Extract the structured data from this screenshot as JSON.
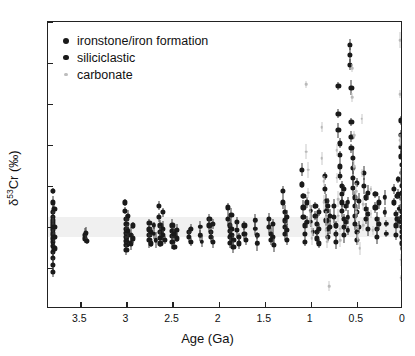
{
  "figure": {
    "background": "#ffffff",
    "frame_color": "#222222",
    "zero_band_color": "#ededed"
  },
  "legend": {
    "position": "top-left",
    "items": [
      {
        "label": "ironstone/iron formation",
        "marker": "filled-circle",
        "color": "#1a1a1a",
        "size": 5.2
      },
      {
        "label": "siliciclastic",
        "marker": "filled-circle",
        "color": "#1a1a1a",
        "size": 4.6
      },
      {
        "label": "carbonate",
        "marker": "small-dot",
        "color": "#b9b9b9",
        "size": 2.6
      }
    ]
  },
  "chart_data": {
    "type": "scatter",
    "title": "",
    "xlabel": "Age (Ga)",
    "ylabel": "δ53Cr (‰)",
    "ylabel_parts": {
      "delta": "δ",
      "mass": "53",
      "element": "Cr (‰)"
    },
    "xlim": [
      3.85,
      0.0
    ],
    "ylim": [
      -1.0,
      2.5
    ],
    "x_reversed": true,
    "grid": false,
    "xticks": [
      3.5,
      3,
      2.5,
      2,
      1.5,
      1,
      0.5,
      0
    ],
    "xticklabels": [
      "3.5",
      "3",
      "2.5",
      "2",
      "1.5",
      "1",
      "0.5",
      "0"
    ],
    "yticks": [
      -1,
      -0.5,
      0,
      0.5,
      1,
      1.5,
      2,
      2.5
    ],
    "yticklabels": [
      "-1",
      "-0.5",
      "0",
      "0.5",
      "1",
      "1.5",
      "2",
      "2.5"
    ],
    "zero_band": {
      "ymin": -0.12,
      "ymax": 0.12
    },
    "series": [
      {
        "name": "ironstone/iron formation",
        "color": "#1a1a1a",
        "marker_size": 5.2,
        "points": [
          [
            3.8,
            0.44
          ],
          [
            3.8,
            0.3
          ],
          [
            3.8,
            0.18
          ],
          [
            3.8,
            0.12
          ],
          [
            3.8,
            0.08
          ],
          [
            3.8,
            0.05
          ],
          [
            3.8,
            0.02
          ],
          [
            3.8,
            -0.01
          ],
          [
            3.8,
            -0.04
          ],
          [
            3.8,
            -0.07
          ],
          [
            3.8,
            -0.1
          ],
          [
            3.8,
            -0.14
          ],
          [
            3.8,
            -0.18
          ],
          [
            3.8,
            -0.23
          ],
          [
            3.8,
            -0.3
          ],
          [
            3.8,
            -0.38
          ],
          [
            3.8,
            -0.46
          ],
          [
            3.8,
            -0.55
          ],
          [
            3.78,
            0.22
          ],
          [
            3.78,
            0.0
          ],
          [
            3.78,
            -0.12
          ],
          [
            3.78,
            -0.26
          ],
          [
            3.45,
            -0.1
          ],
          [
            3.45,
            -0.14
          ],
          [
            3.43,
            -0.17
          ],
          [
            3.44,
            -0.07
          ],
          [
            3.02,
            0.3
          ],
          [
            3.02,
            0.2
          ],
          [
            3.0,
            0.1
          ],
          [
            3.0,
            0.04
          ],
          [
            3.0,
            -0.02
          ],
          [
            3.0,
            -0.07
          ],
          [
            3.0,
            -0.12
          ],
          [
            3.0,
            -0.17
          ],
          [
            3.0,
            -0.22
          ],
          [
            3.0,
            -0.28
          ],
          [
            2.98,
            0.14
          ],
          [
            2.98,
            -0.05
          ],
          [
            2.95,
            -0.1
          ],
          [
            2.95,
            -0.2
          ],
          [
            2.93,
            0.02
          ],
          [
            2.93,
            -0.14
          ],
          [
            2.75,
            0.05
          ],
          [
            2.75,
            -0.03
          ],
          [
            2.75,
            -0.1
          ],
          [
            2.75,
            -0.16
          ],
          [
            2.73,
            -0.06
          ],
          [
            2.73,
            -0.2
          ],
          [
            2.65,
            0.26
          ],
          [
            2.65,
            0.12
          ],
          [
            2.63,
            0.02
          ],
          [
            2.63,
            -0.06
          ],
          [
            2.63,
            -0.13
          ],
          [
            2.63,
            -0.2
          ],
          [
            2.6,
            0.18
          ],
          [
            2.6,
            -0.02
          ],
          [
            2.6,
            -0.1
          ],
          [
            2.58,
            -0.16
          ],
          [
            2.5,
            0.02
          ],
          [
            2.5,
            -0.05
          ],
          [
            2.5,
            -0.11
          ],
          [
            2.5,
            -0.18
          ],
          [
            2.48,
            -0.08
          ],
          [
            2.48,
            -0.24
          ],
          [
            2.45,
            -0.04
          ],
          [
            2.45,
            -0.14
          ],
          [
            2.32,
            -0.06
          ],
          [
            2.32,
            -0.12
          ],
          [
            2.3,
            -0.18
          ],
          [
            2.3,
            -0.02
          ],
          [
            2.1,
            0.1
          ],
          [
            2.1,
            0.02
          ],
          [
            2.08,
            -0.06
          ],
          [
            2.08,
            -0.12
          ],
          [
            2.06,
            -0.18
          ],
          [
            2.06,
            0.04
          ],
          [
            1.9,
            0.24
          ],
          [
            1.9,
            0.1
          ],
          [
            1.88,
            0.02
          ],
          [
            1.88,
            -0.05
          ],
          [
            1.88,
            -0.12
          ],
          [
            1.88,
            -0.19
          ],
          [
            1.86,
            0.15
          ],
          [
            1.86,
            -0.02
          ],
          [
            1.86,
            -0.1
          ],
          [
            1.84,
            -0.16
          ],
          [
            1.84,
            -0.24
          ],
          [
            1.8,
            0.06
          ],
          [
            1.8,
            -0.04
          ],
          [
            1.78,
            -0.12
          ],
          [
            1.78,
            -0.2
          ],
          [
            1.72,
            0.02
          ],
          [
            1.72,
            -0.08
          ],
          [
            1.7,
            -0.16
          ],
          [
            1.45,
            0.1
          ],
          [
            1.45,
            0.0
          ],
          [
            1.43,
            -0.08
          ],
          [
            1.43,
            -0.16
          ],
          [
            1.41,
            0.04
          ],
          [
            1.41,
            -0.12
          ],
          [
            1.4,
            -0.22
          ],
          [
            1.3,
            0.44
          ],
          [
            1.3,
            0.3
          ],
          [
            1.28,
            0.18
          ],
          [
            1.28,
            0.08
          ],
          [
            1.28,
            0.0
          ],
          [
            1.28,
            -0.08
          ],
          [
            1.26,
            -0.16
          ],
          [
            1.26,
            0.12
          ],
          [
            1.26,
            -0.04
          ],
          [
            1.1,
            0.7
          ],
          [
            1.1,
            0.52
          ],
          [
            1.08,
            0.38
          ],
          [
            1.08,
            0.24
          ],
          [
            1.08,
            0.12
          ],
          [
            1.06,
            0.02
          ],
          [
            1.06,
            -0.08
          ],
          [
            1.06,
            -0.18
          ],
          [
            1.04,
            0.3
          ],
          [
            1.04,
            0.06
          ],
          [
            0.95,
            0.26
          ],
          [
            0.95,
            0.14
          ],
          [
            0.93,
            0.04
          ],
          [
            0.93,
            -0.06
          ],
          [
            0.93,
            -0.14
          ],
          [
            0.91,
            0.18
          ],
          [
            0.91,
            -0.02
          ],
          [
            0.91,
            -0.2
          ],
          [
            0.85,
            0.62
          ],
          [
            0.85,
            0.46
          ],
          [
            0.83,
            0.32
          ],
          [
            0.83,
            0.2
          ],
          [
            0.83,
            0.08
          ],
          [
            0.81,
            -0.02
          ],
          [
            0.81,
            -0.12
          ],
          [
            0.81,
            0.26
          ],
          [
            0.79,
            0.14
          ],
          [
            0.79,
            0.0
          ],
          [
            0.75,
            0.26
          ],
          [
            0.75,
            0.12
          ],
          [
            0.73,
            0.02
          ],
          [
            0.73,
            -0.08
          ],
          [
            0.73,
            -0.18
          ],
          [
            0.7,
            1.72
          ],
          [
            0.7,
            1.38
          ],
          [
            0.7,
            1.18
          ],
          [
            0.68,
            1.02
          ],
          [
            0.68,
            0.88
          ],
          [
            0.68,
            0.74
          ],
          [
            0.68,
            0.62
          ],
          [
            0.66,
            0.5
          ],
          [
            0.66,
            0.4
          ],
          [
            0.66,
            0.3
          ],
          [
            0.66,
            0.2
          ],
          [
            0.64,
            0.1
          ],
          [
            0.64,
            0.0
          ],
          [
            0.64,
            -0.1
          ],
          [
            0.64,
            0.46
          ],
          [
            0.62,
            0.26
          ],
          [
            0.62,
            0.06
          ],
          [
            0.58,
            2.22
          ],
          [
            0.58,
            2.1
          ],
          [
            0.58,
            1.98
          ],
          [
            0.56,
            1.7
          ],
          [
            0.56,
            1.28
          ],
          [
            0.56,
            1.1
          ],
          [
            0.56,
            0.96
          ],
          [
            0.54,
            0.84
          ],
          [
            0.54,
            0.72
          ],
          [
            0.54,
            0.6
          ],
          [
            0.54,
            0.48
          ],
          [
            0.52,
            0.36
          ],
          [
            0.52,
            0.26
          ],
          [
            0.52,
            0.14
          ],
          [
            0.52,
            0.04
          ],
          [
            0.5,
            -0.06
          ],
          [
            0.5,
            -0.16
          ],
          [
            0.5,
            0.54
          ],
          [
            0.5,
            0.18
          ],
          [
            0.48,
            0.32
          ],
          [
            0.48,
            0.0
          ],
          [
            0.42,
            0.66
          ],
          [
            0.42,
            0.5
          ],
          [
            0.4,
            0.36
          ],
          [
            0.4,
            0.22
          ],
          [
            0.4,
            0.1
          ],
          [
            0.38,
            -0.02
          ],
          [
            0.38,
            0.42
          ],
          [
            0.38,
            0.16
          ],
          [
            0.3,
            0.4
          ],
          [
            0.3,
            0.24
          ],
          [
            0.28,
            0.1
          ],
          [
            0.28,
            -0.02
          ],
          [
            0.28,
            -0.12
          ],
          [
            0.26,
            0.3
          ],
          [
            0.26,
            0.04
          ],
          [
            0.1,
            0.46
          ],
          [
            0.1,
            0.3
          ],
          [
            0.08,
            0.16
          ],
          [
            0.08,
            0.02
          ],
          [
            0.08,
            -0.1
          ],
          [
            0.06,
            0.38
          ],
          [
            0.06,
            0.1
          ],
          [
            0.02,
            1.3
          ],
          [
            0.02,
            1.12
          ],
          [
            0.02,
            0.98
          ],
          [
            0.02,
            0.86
          ],
          [
            0.01,
            0.76
          ],
          [
            0.01,
            0.66
          ],
          [
            0.01,
            0.58
          ],
          [
            0.01,
            0.5
          ],
          [
            0.01,
            0.42
          ],
          [
            0.01,
            0.34
          ],
          [
            0.01,
            0.26
          ],
          [
            0.01,
            0.18
          ],
          [
            0.01,
            0.12
          ],
          [
            0.01,
            0.06
          ],
          [
            0.01,
            0.0
          ],
          [
            0.01,
            -0.06
          ],
          [
            0.01,
            -0.12
          ],
          [
            0.01,
            -0.2
          ],
          [
            0.0,
            0.92
          ],
          [
            0.0,
            0.7
          ],
          [
            0.0,
            0.54
          ],
          [
            0.0,
            0.38
          ],
          [
            0.0,
            0.22
          ],
          [
            0.0,
            0.08
          ],
          [
            0.0,
            -0.02
          ],
          [
            0.0,
            -0.14
          ],
          [
            0.0,
            -0.26
          ]
        ]
      },
      {
        "name": "siliciclastic",
        "color": "#1a1a1a",
        "marker_size": 4.4,
        "points": [
          [
            2.7,
            0.02
          ],
          [
            2.7,
            -0.08
          ],
          [
            2.68,
            -0.16
          ],
          [
            2.2,
            0.0
          ],
          [
            2.2,
            -0.1
          ],
          [
            2.18,
            -0.18
          ],
          [
            1.6,
            0.08
          ],
          [
            1.6,
            -0.02
          ],
          [
            1.58,
            -0.1
          ],
          [
            1.58,
            -0.2
          ],
          [
            1.0,
            0.2
          ],
          [
            1.0,
            0.06
          ],
          [
            0.98,
            -0.06
          ],
          [
            0.6,
            0.3
          ],
          [
            0.6,
            0.12
          ],
          [
            0.6,
            -0.04
          ],
          [
            0.2,
            0.36
          ],
          [
            0.2,
            0.18
          ],
          [
            0.18,
            0.04
          ],
          [
            0.18,
            -0.08
          ],
          [
            0.05,
            0.58
          ],
          [
            0.05,
            0.4
          ],
          [
            0.04,
            0.22
          ],
          [
            0.04,
            0.06
          ]
        ]
      },
      {
        "name": "carbonate",
        "color": "#b9b9b9",
        "marker_size": 2.6,
        "points": [
          [
            1.05,
            1.74
          ],
          [
            1.05,
            0.92
          ],
          [
            1.03,
            0.7
          ],
          [
            1.03,
            0.42
          ],
          [
            1.01,
            0.26
          ],
          [
            1.01,
            0.1
          ],
          [
            0.99,
            -0.02
          ],
          [
            0.99,
            -0.14
          ],
          [
            0.88,
            1.22
          ],
          [
            0.88,
            0.84
          ],
          [
            0.86,
            0.56
          ],
          [
            0.86,
            0.3
          ],
          [
            0.84,
            0.12
          ],
          [
            0.84,
            -0.04
          ],
          [
            0.82,
            -0.18
          ],
          [
            0.8,
            -0.72
          ],
          [
            0.72,
            0.94
          ],
          [
            0.72,
            0.6
          ],
          [
            0.7,
            0.34
          ],
          [
            0.7,
            0.14
          ],
          [
            0.68,
            -0.02
          ],
          [
            0.68,
            -0.16
          ],
          [
            0.55,
            1.94
          ],
          [
            0.55,
            1.58
          ],
          [
            0.53,
            1.12
          ],
          [
            0.53,
            0.74
          ],
          [
            0.51,
            0.44
          ],
          [
            0.51,
            0.18
          ],
          [
            0.49,
            0.0
          ],
          [
            0.49,
            -0.14
          ],
          [
            0.47,
            -0.26
          ],
          [
            0.45,
            1.32
          ],
          [
            0.45,
            0.66
          ],
          [
            0.43,
            0.28
          ],
          [
            0.43,
            0.02
          ],
          [
            0.35,
            0.46
          ],
          [
            0.35,
            0.16
          ],
          [
            0.33,
            -0.04
          ],
          [
            0.03,
            2.28
          ],
          [
            0.03,
            1.62
          ],
          [
            0.03,
            1.06
          ],
          [
            0.02,
            0.62
          ],
          [
            0.02,
            0.3
          ],
          [
            0.02,
            -0.4
          ],
          [
            0.02,
            -0.62
          ]
        ]
      }
    ]
  }
}
